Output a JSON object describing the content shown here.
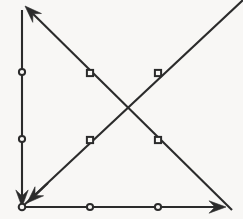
{
  "figure": {
    "title": "Directed line diagram with four segments and node markers",
    "width": 243,
    "height": 219,
    "background_color": "#f8f7f5",
    "stroke_color": "#2b2b2b",
    "node_fill_color": "#f8f7f5",
    "stroke_width": 2.1
  },
  "chart_data": {
    "type": "diagram",
    "title": "",
    "xlabel": "",
    "ylabel": "",
    "grid": false,
    "legend": "none",
    "xlim": [
      0,
      243
    ],
    "ylim": [
      0,
      219
    ],
    "coordinate_note": "Pixel coordinates, origin at top-left of the 243x219 image.",
    "vertices": [
      {
        "id": "origin",
        "x": 22,
        "y": 207
      },
      {
        "id": "top-left",
        "x": 22,
        "y": 10
      },
      {
        "id": "bottom-right",
        "x": 226,
        "y": 207
      },
      {
        "id": "diagonal-top-left-tip",
        "x": 25,
        "y": 6
      },
      {
        "id": "diagonal-bottom-right-tail",
        "x": 232,
        "y": 210
      },
      {
        "id": "diagonal-top-right-exit",
        "x": 243,
        "y": 0
      },
      {
        "id": "diagonal-crossing",
        "x": 125,
        "y": 112
      }
    ],
    "edges": [
      {
        "id": "vertical-edge",
        "label": "vertical line",
        "from": {
          "x": 22,
          "y": 10
        },
        "to": {
          "x": 22,
          "y": 207
        },
        "arrow_at": "to",
        "arrow_direction": "down",
        "marker_shape": "circle",
        "markers": [
          {
            "x": 22,
            "y": 72
          },
          {
            "x": 22,
            "y": 139
          }
        ]
      },
      {
        "id": "horizontal-edge",
        "label": "horizontal line",
        "from": {
          "x": 22,
          "y": 207
        },
        "to": {
          "x": 226,
          "y": 207
        },
        "arrow_at": "to",
        "arrow_direction": "right",
        "marker_shape": "circle",
        "markers": [
          {
            "x": 90,
            "y": 207
          },
          {
            "x": 158,
            "y": 207
          }
        ]
      },
      {
        "id": "descending-diagonal-edge",
        "label": "descending diagonal from bottom-right to top-left",
        "from": {
          "x": 232,
          "y": 210
        },
        "to": {
          "x": 25,
          "y": 6
        },
        "arrow_at": "to",
        "arrow_direction": "up-left",
        "marker_shape": "square",
        "markers": [
          {
            "x": 90,
            "y": 73
          },
          {
            "x": 158,
            "y": 140
          }
        ]
      },
      {
        "id": "ascending-diagonal-edge",
        "label": "ascending diagonal from origin to top-right edge",
        "from": {
          "x": 22,
          "y": 207
        },
        "to": {
          "x": 243,
          "y": 0
        },
        "arrow_at": "none",
        "arrow_direction": "none",
        "marker_shape": "square",
        "markers": [
          {
            "x": 90,
            "y": 140
          },
          {
            "x": 158,
            "y": 73
          }
        ]
      },
      {
        "id": "origin-arrow-edge",
        "label": "short diagonal arrow into origin",
        "from": {
          "x": 48,
          "y": 183
        },
        "to": {
          "x": 27,
          "y": 203
        },
        "arrow_at": "to",
        "arrow_direction": "down-left",
        "marker_shape": "none",
        "markers": []
      }
    ],
    "corner_nodes": [
      {
        "id": "origin-node",
        "x": 22,
        "y": 207,
        "shape": "circle"
      }
    ],
    "arrowheads": [
      {
        "id": "arrow-up-left",
        "x": 25,
        "y": 6,
        "direction": "up-left",
        "angle_deg": 225
      },
      {
        "id": "arrow-down",
        "x": 22,
        "y": 200,
        "direction": "down",
        "angle_deg": 90
      },
      {
        "id": "arrow-down-left",
        "x": 27,
        "y": 203,
        "direction": "down-left",
        "angle_deg": 135
      },
      {
        "id": "arrow-right",
        "x": 226,
        "y": 207,
        "direction": "right",
        "angle_deg": 0
      }
    ]
  }
}
